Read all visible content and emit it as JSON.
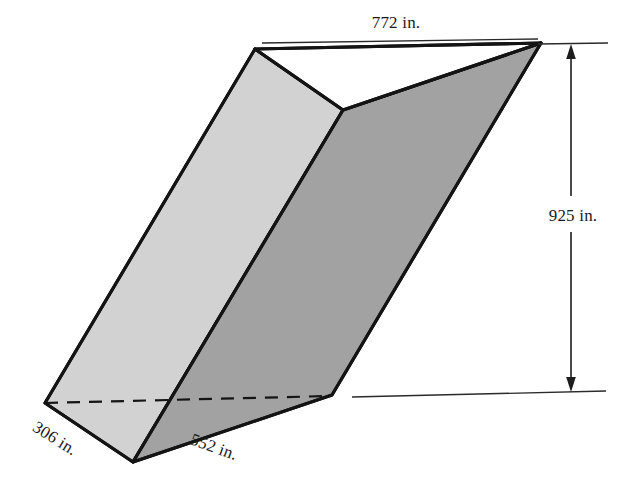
{
  "figure": {
    "background_color": "#ffffff",
    "outline_color": "#141414",
    "faces": {
      "top_triangle_color": "#ffffff",
      "left_face_color": "#d2d2d2",
      "right_face_color": "#a2a2a2",
      "bottom_left_face_color": "#c6c6c6"
    }
  },
  "labels": {
    "top_edge": "772 in.",
    "vertical_height": "925 in.",
    "base_left": "306 in.",
    "base_front": "552 in."
  },
  "label_positions": {
    "top_edge": {
      "x": 396,
      "y": 28,
      "rotation": 0
    },
    "vertical_height": {
      "x": 573,
      "y": 215,
      "rotation": 0
    },
    "base_left": {
      "x": 52,
      "y": 443,
      "rotation": 32
    },
    "base_front": {
      "x": 210,
      "y": 452,
      "rotation": 20
    }
  },
  "geometry": {
    "vertices": {
      "top_back_left": {
        "x": 255,
        "y": 49
      },
      "top_back_right": {
        "x": 541,
        "y": 43
      },
      "top_front": {
        "x": 343,
        "y": 110
      },
      "bottom_back_left": {
        "x": 45,
        "y": 403
      },
      "bottom_front_left": {
        "x": 133,
        "y": 462
      },
      "bottom_right": {
        "x": 332,
        "y": 395
      }
    },
    "hidden_edge": {
      "from": "bottom_back_left",
      "to": "bottom_right"
    },
    "dimension_line": {
      "x": 571,
      "y_top": 47,
      "y_bottom": 389,
      "top_extension": {
        "x1": 538,
        "y1": 44,
        "x2": 608,
        "y2": 43
      },
      "bottom_extension": {
        "x1": 352,
        "y1": 397,
        "x2": 606,
        "y2": 391
      }
    }
  },
  "measurements": {
    "unit": "in.",
    "top_edge_length": 772,
    "height": 925,
    "base_left_edge_length": 306,
    "base_front_edge_length": 552
  }
}
